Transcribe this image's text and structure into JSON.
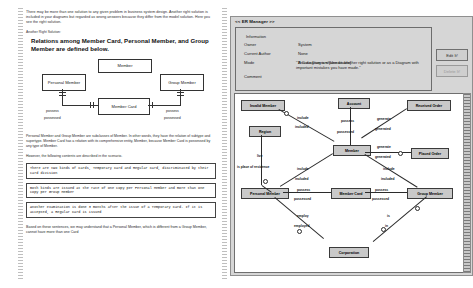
{
  "document": {
    "intro": "There may be more than one solution to any given problem in business system design. Another right solution is included in your diagrams but regarded as wrong answers because they differ from the model solution. Here you see the right solution.",
    "solution_label": "Another Right Solution:",
    "heading": "Relations among Member Card, Personal Member, and Group Member are defined below.",
    "diagram": {
      "entities": [
        {
          "name": "Member"
        },
        {
          "name": "Personal Member"
        },
        {
          "name": "Group Member"
        },
        {
          "name": "Member Card"
        }
      ],
      "labels": [
        "possess",
        "possessed",
        "possess",
        "possessed"
      ]
    },
    "explanation": "Personal Member and Group Member are subclasses of Member. In other words, they have the relation of subtype and supertype. Member Card has a relation with its comprehensive entity, Member, because Member Card is possessed by any type of Member.",
    "however": "However, the following contents are described in the scenario.",
    "scenario": [
      "There are two kinds of Cards, Temporary Card and Regular Card, discriminated by their card division",
      "Both kinds are issued at the rate of one copy per Personal Member and more than one copy  per Group Member",
      "Another examination is done 3 months after the issue of a Temporary Card. If it is accepted, a Regular Card is issued"
    ],
    "closing": "Based on these sentences, we may understand that a Personal Member, which is different from a Group Member, cannot have more than one Card"
  },
  "app": {
    "title": "<< ER Manager >>",
    "info": {
      "legend": "Information",
      "fields": [
        {
          "key": "Owner",
          "value": "System"
        },
        {
          "key": "Current Author",
          "value": "None"
        },
        {
          "key": "Mode",
          "value": "A Case Diagram   [Uneditable]"
        },
        {
          "key": "Comment",
          "value": ""
        }
      ],
      "comment": "\"This diagram is shown as another right solution or as a Diagram with important mistakes you have made.\""
    },
    "buttons": [
      {
        "label": "Edit It!",
        "state": "enabled"
      },
      {
        "label": "Delete It!",
        "state": "disabled"
      }
    ],
    "canvas": {
      "entities": [
        {
          "name": "Invalid Member"
        },
        {
          "name": "Account"
        },
        {
          "name": "Received Order"
        },
        {
          "name": "Region"
        },
        {
          "name": "Member"
        },
        {
          "name": "Placed Order"
        },
        {
          "name": "Personal Member"
        },
        {
          "name": "Member Card"
        },
        {
          "name": "Group Member"
        },
        {
          "name": "Corporation"
        }
      ],
      "relations": [
        {
          "a": "include",
          "b": "included"
        },
        {
          "a": "possess",
          "b": "possessed"
        },
        {
          "a": "generate",
          "b": "generated"
        },
        {
          "a": "live",
          "b": "is place of residence"
        },
        {
          "a": "generate",
          "b": "generated"
        },
        {
          "a": "include",
          "b": "included"
        },
        {
          "a": "include",
          "b": "included"
        },
        {
          "a": "possess",
          "b": "possessed"
        },
        {
          "a": "possess",
          "b": "possessed"
        },
        {
          "a": "employ",
          "b": "employed"
        },
        {
          "a": "is",
          "b": "in"
        }
      ]
    }
  }
}
